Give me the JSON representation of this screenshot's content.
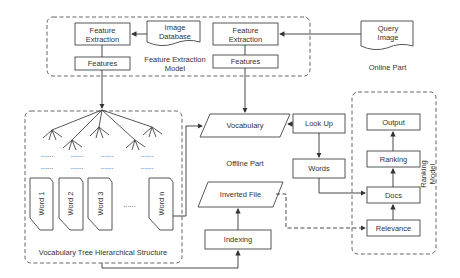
{
  "diagram": {
    "groups": {
      "feature_extraction_model": "Feature Extraction Model",
      "online_part": "Online Part",
      "offline_part": "Offline Part",
      "vocab_tree": "Vocabulary Tree Hierarchical Structure",
      "ranking_model": "Ranking Model"
    },
    "nodes": {
      "fe_left": "Feature Extraction",
      "features_left": "Features",
      "image_db": "Image Database",
      "fe_right": "Feature Extraction",
      "features_right": "Features",
      "query_image": "Query Image",
      "vocabulary": "Vocabulary",
      "lookup": "Look Up",
      "words": "Words",
      "inverted_file": "Inverted File",
      "indexing": "Indexing",
      "output": "Output",
      "ranking": "Ranking",
      "docs": "Docs",
      "relevance": "Relevance"
    },
    "word_cards": [
      "Word 1",
      "Word 2",
      "Word 3",
      "Word n"
    ],
    "ellipsis": "......",
    "edge_color": "#333333",
    "dash_color": "#555555"
  }
}
